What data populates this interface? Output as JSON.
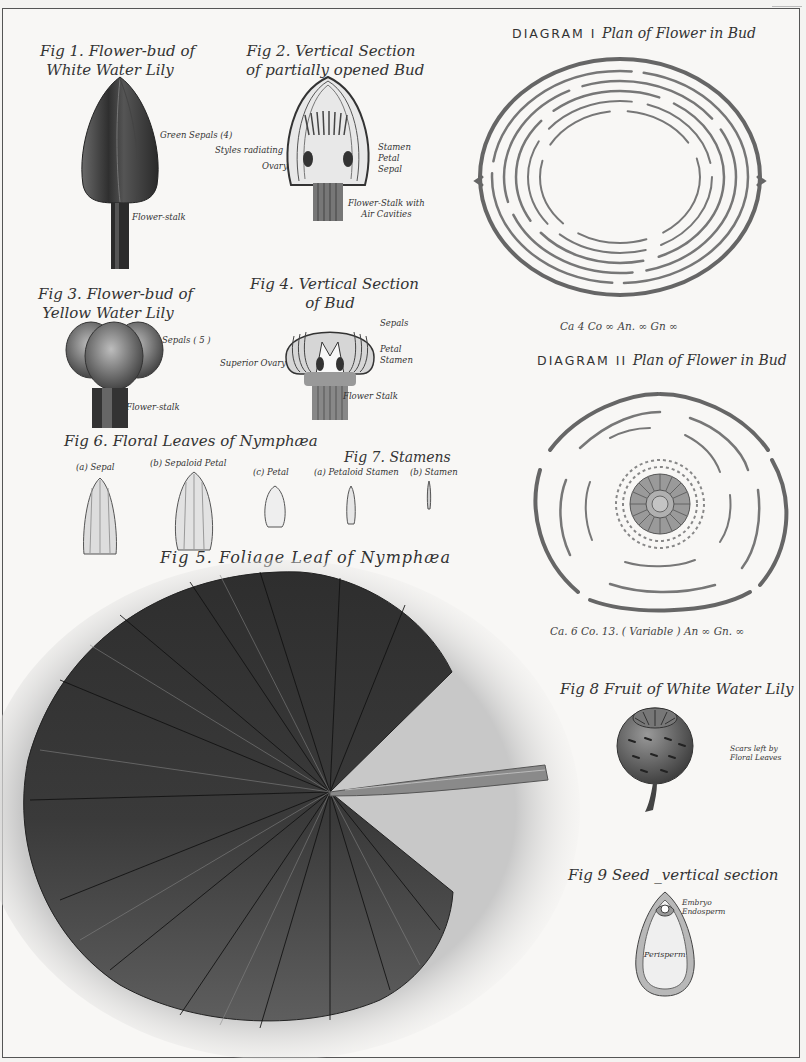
{
  "plate": {
    "subject": "Water Lily (Nymphaea / Nuphar) botanical plate"
  },
  "figures": {
    "fig1": {
      "title_line1": "Fig 1. Flower-bud of",
      "title_line2": "White Water Lily",
      "labels": {
        "sepals": "Green Sepals (4)",
        "stalk": "Flower-stalk"
      }
    },
    "fig2": {
      "title_line1": "Fig 2. Vertical Section",
      "title_line2": "of partially opened Bud",
      "labels": {
        "styles": "Styles radiating",
        "ovary": "Ovary",
        "stamen": "Stamen",
        "petal": "Petal",
        "sepal": "Sepal",
        "stalk_line1": "Flower-Stalk with",
        "stalk_line2": "Air Cavities"
      }
    },
    "fig3": {
      "title_line1": "Fig 3. Flower-bud of",
      "title_line2": "Yellow Water Lily",
      "labels": {
        "sepals": "Sepals ( 5 )",
        "stalk": "Flower-stalk"
      }
    },
    "fig4": {
      "title_line1": "Fig 4. Vertical Section",
      "title_line2": "of Bud",
      "labels": {
        "sepals": "Sepals",
        "petal": "Petal",
        "stamen": "Stamen",
        "ovary": "Superior Ovary",
        "stalk": "Flower Stalk"
      }
    },
    "fig5": {
      "title": "Fig 5. Foliage Leaf of Nymphæa"
    },
    "fig6": {
      "title": "Fig 6. Floral Leaves of Nymphæa",
      "labels": {
        "a": "(a) Sepal",
        "b": "(b) Sepaloid Petal",
        "c": "(c) Petal"
      }
    },
    "fig7": {
      "title": "Fig 7. Stamens",
      "labels": {
        "a": "(a) Petaloid Stamen",
        "b": "(b) Stamen"
      }
    },
    "fig8": {
      "title": "Fig 8  Fruit of White Water Lily",
      "labels": {
        "scars_line1": "Scars left by",
        "scars_line2": "Floral Leaves"
      }
    },
    "fig9": {
      "title": "Fig 9  Seed _vertical  section",
      "labels": {
        "embryo": "Embryo",
        "endosperm": "Endosperm",
        "perisperm": "Perisperm"
      }
    }
  },
  "diagrams": {
    "d1": {
      "caps": "DIAGRAM I",
      "title": "Plan of Flower in Bud",
      "formula": "Ca 4   Co ∞ An. ∞   Gn ∞"
    },
    "d2": {
      "caps": "DIAGRAM II",
      "title": "Plan of Flower in Bud",
      "formula": "Ca. 6   Co. 13. ( Variable )  An ∞    Gn. ∞"
    }
  },
  "colors": {
    "paper": "#f8f7f5",
    "ink": "#333333",
    "leaf_dark": "#2e2e2e",
    "leaf_mid": "#5a5a5a",
    "petal_gray": "#8a8a8a"
  }
}
